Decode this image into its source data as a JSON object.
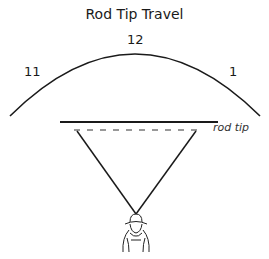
{
  "title": "Rod Tip Travel",
  "clock_positions": [
    {
      "label": "11",
      "x": 24,
      "y": 66
    },
    {
      "label": "12",
      "x": 127,
      "y": 33
    },
    {
      "label": "1",
      "x": 229,
      "y": 66
    }
  ],
  "annotations": {
    "rod_tip_label": "rod tip"
  },
  "colors": {
    "stroke": "#1a1a1a",
    "background": "#ffffff"
  }
}
